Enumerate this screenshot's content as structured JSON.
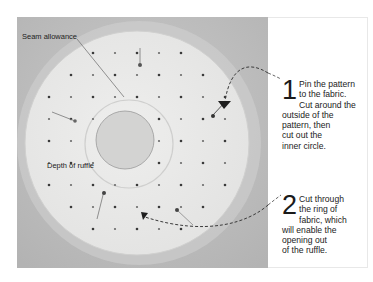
{
  "figure": {
    "labels": {
      "seam_allowance": "Seam allowance",
      "depth_of_ruffle": "Depth of ruffle"
    },
    "steps": [
      {
        "number": "1",
        "lines": [
          "Pin the pattern",
          "to the fabric.",
          "Cut around the",
          "outside of the",
          "pattern, then",
          "cut out the",
          "inner circle."
        ]
      },
      {
        "number": "2",
        "lines": [
          "Cut through",
          "the ring of",
          "fabric, which",
          "will enable the",
          "opening out",
          "of the ruffle."
        ]
      }
    ],
    "colors": {
      "photo_background": "#bdbdbd",
      "pattern_paper": "#ebebea",
      "inner_circle": "#cfcfcf",
      "dot": "#3a3a3a",
      "arrow": "#333333",
      "text": "#222222"
    },
    "icons": [
      "pin-icon",
      "arrow-head-icon",
      "dashed-arrow-icon"
    ]
  }
}
